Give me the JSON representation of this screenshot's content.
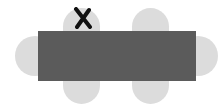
{
  "diagram": {
    "type": "table-seating",
    "table": {
      "color": "#5b5b5b",
      "shape": "rectangle"
    },
    "seat_color": "#dcdcdc",
    "seats": [
      {
        "position": "top-left",
        "marked": true
      },
      {
        "position": "top-right",
        "marked": false
      },
      {
        "position": "left",
        "marked": false
      },
      {
        "position": "right",
        "marked": false
      },
      {
        "position": "bottom-left",
        "marked": false
      },
      {
        "position": "bottom-right",
        "marked": false
      }
    ],
    "mark": {
      "symbol": "X",
      "color": "#111111"
    }
  }
}
